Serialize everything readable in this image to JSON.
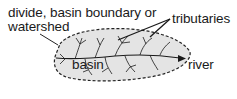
{
  "diagram": {
    "labels": {
      "divide_line1": "divide, basin boundary or",
      "divide_line2": "watershed",
      "tributaries": "tributaries",
      "basin": "basin",
      "river": "river"
    },
    "colors": {
      "background": "#ffffff",
      "basin_fill": "#e4e4e4",
      "boundary": "#222222",
      "streams": "#1a1a1a",
      "text": "#1a1a1a"
    },
    "elements": {
      "boundary_style": "dashed",
      "river_direction": "east",
      "tributary_pointers": 2
    }
  }
}
